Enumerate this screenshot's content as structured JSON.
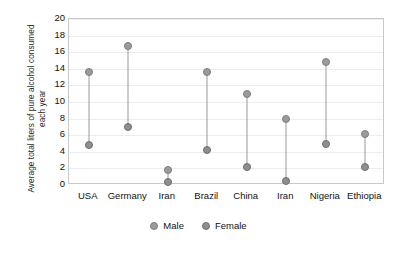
{
  "chart_data": {
    "type": "scatter",
    "title": "",
    "xlabel": "",
    "ylabel": "Average total liters of pure alcohol consumed each year",
    "ylim": [
      0,
      20
    ],
    "ytick_step": 2,
    "yticks": [
      20,
      18,
      16,
      14,
      12,
      10,
      8,
      6,
      4,
      2,
      0
    ],
    "grid": true,
    "legend_position": "bottom",
    "categories": [
      "USA",
      "Germany",
      "Iran",
      "Brazil",
      "China",
      "Iran",
      "Nigeria",
      "Ethiopia"
    ],
    "series": [
      {
        "name": "Male",
        "color": "#9b9b9b",
        "values": [
          13.6,
          16.8,
          1.8,
          13.6,
          11.0,
          8.0,
          14.8,
          6.2
        ]
      },
      {
        "name": "Female",
        "color": "#8e8e8e",
        "values": [
          4.8,
          7.0,
          0.4,
          4.2,
          2.2,
          0.5,
          5.0,
          2.2
        ]
      }
    ]
  },
  "legend": {
    "items": [
      {
        "label": "Male",
        "icon": "circle-marker-icon"
      },
      {
        "label": "Female",
        "icon": "circle-marker-icon"
      }
    ]
  }
}
